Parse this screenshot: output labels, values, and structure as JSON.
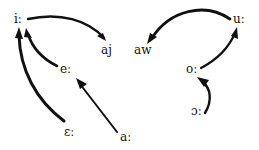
{
  "diagram": {
    "type": "vowel-shift-diagram",
    "nodes": {
      "i_long": {
        "label": "iː",
        "x": 14,
        "y": 13
      },
      "e_long": {
        "label": "eː",
        "x": 60,
        "y": 63
      },
      "open_e_long": {
        "label": "ɛː",
        "x": 64,
        "y": 126
      },
      "a_long": {
        "label": "aː",
        "x": 120,
        "y": 131
      },
      "aj": {
        "label": "aj",
        "x": 101,
        "y": 44
      },
      "aw": {
        "label": "aw",
        "x": 134,
        "y": 44
      },
      "u_long": {
        "label": "uː",
        "x": 233,
        "y": 13
      },
      "o_long": {
        "label": "oː",
        "x": 186,
        "y": 63
      },
      "open_o_long": {
        "label": "ɔː",
        "x": 191,
        "y": 105
      }
    },
    "arrows": [
      {
        "from": "i_long",
        "to": "aj"
      },
      {
        "from": "e_long",
        "to": "i_long"
      },
      {
        "from": "open_e_long",
        "to": "i_long"
      },
      {
        "from": "a_long",
        "to": "e_long"
      },
      {
        "from": "u_long",
        "to": "aw"
      },
      {
        "from": "o_long",
        "to": "u_long"
      },
      {
        "from": "open_o_long",
        "to": "o_long"
      }
    ],
    "colors": {
      "ink": "#111111",
      "background": "#ffffff"
    }
  }
}
